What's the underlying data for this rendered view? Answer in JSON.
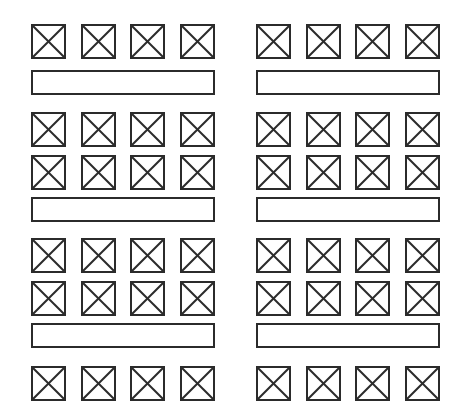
{
  "page": {
    "background_color": "#ffffff",
    "stroke_color": "#2b2b2b",
    "width": 462,
    "height": 413,
    "columns_count": 2,
    "rows_per_column": 9
  },
  "glyphs": {
    "image_placeholder": "crossed-box-icon",
    "bar_placeholder": "empty-bar-icon"
  },
  "columns": [
    {
      "name": "left-column",
      "x": 31,
      "width": 184,
      "rows": [
        {
          "type": "image-row",
          "y": 24,
          "count": 4,
          "box": 35
        },
        {
          "type": "bar-row",
          "y": 70,
          "count": 1,
          "height": 25
        },
        {
          "type": "image-row",
          "y": 112,
          "count": 4,
          "box": 35
        },
        {
          "type": "image-row",
          "y": 155,
          "count": 4,
          "box": 35
        },
        {
          "type": "bar-row",
          "y": 197,
          "count": 1,
          "height": 25
        },
        {
          "type": "image-row",
          "y": 238,
          "count": 4,
          "box": 35
        },
        {
          "type": "image-row",
          "y": 281,
          "count": 4,
          "box": 35
        },
        {
          "type": "bar-row",
          "y": 323,
          "count": 1,
          "height": 25
        },
        {
          "type": "image-row",
          "y": 366,
          "count": 4,
          "box": 35
        }
      ]
    },
    {
      "name": "right-column",
      "x": 256,
      "width": 184,
      "rows": [
        {
          "type": "image-row",
          "y": 24,
          "count": 4,
          "box": 35
        },
        {
          "type": "bar-row",
          "y": 70,
          "count": 1,
          "height": 25
        },
        {
          "type": "image-row",
          "y": 112,
          "count": 4,
          "box": 35
        },
        {
          "type": "image-row",
          "y": 155,
          "count": 4,
          "box": 35
        },
        {
          "type": "bar-row",
          "y": 197,
          "count": 1,
          "height": 25
        },
        {
          "type": "image-row",
          "y": 238,
          "count": 4,
          "box": 35
        },
        {
          "type": "image-row",
          "y": 281,
          "count": 4,
          "box": 35
        },
        {
          "type": "bar-row",
          "y": 323,
          "count": 1,
          "height": 25
        },
        {
          "type": "image-row",
          "y": 366,
          "count": 4,
          "box": 35
        }
      ]
    }
  ]
}
